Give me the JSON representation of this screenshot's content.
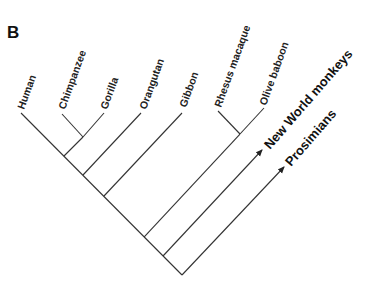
{
  "panel_label": "B",
  "taxa": [
    {
      "name": "Human"
    },
    {
      "name": "Chimpanzee"
    },
    {
      "name": "Gorilla"
    },
    {
      "name": "Orangutan"
    },
    {
      "name": "Gibbon"
    },
    {
      "name": "Rhesus macaque"
    },
    {
      "name": "Olive baboon"
    }
  ],
  "outgroups": [
    {
      "name": "New World monkeys"
    },
    {
      "name": "Prosimians"
    }
  ],
  "colors": {
    "line": "#333333",
    "text": "#222222",
    "background": "#ffffff"
  }
}
